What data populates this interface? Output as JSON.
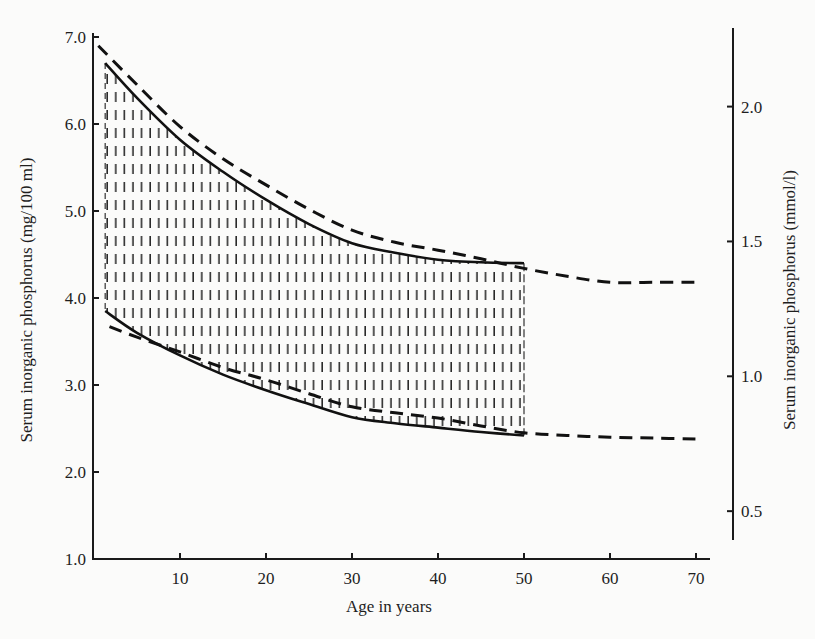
{
  "chart_data": {
    "type": "line",
    "title": "",
    "xlabel": "Age in years",
    "ylabel": "Serum inorganic phosphorus (mg/100 ml)",
    "y2label": "Serum inorganic phosphorus (mmol/l)",
    "xlim": [
      0,
      72
    ],
    "ylim": [
      1.0,
      7.0
    ],
    "y2lim": [
      0.35,
      2.3
    ],
    "x_ticks": [
      10,
      20,
      30,
      40,
      50,
      60,
      70
    ],
    "x_tick_labels": [
      "10",
      "20",
      "30",
      "40",
      "50",
      "60",
      "70"
    ],
    "y_ticks": [
      1.0,
      2.0,
      3.0,
      4.0,
      5.0,
      6.0,
      7.0
    ],
    "y_tick_labels": [
      "1.0",
      "2.0",
      "3.0",
      "4.0",
      "5.0",
      "6.0",
      "7.0"
    ],
    "y2_ticks": [
      0.5,
      1.0,
      1.5,
      2.0
    ],
    "y2_tick_labels": [
      "0.5",
      "1.0",
      "1.5",
      "2.0"
    ],
    "mg_per_mmol": 3.1,
    "grid": false,
    "legend": "none",
    "series": [
      {
        "name": "upper-limit-solid",
        "style": "solid",
        "x": [
          1.3,
          5,
          10,
          15,
          20,
          25,
          30,
          35,
          40,
          45,
          50
        ],
        "y": [
          6.7,
          6.3,
          5.82,
          5.45,
          5.13,
          4.85,
          4.63,
          4.52,
          4.44,
          4.41,
          4.4
        ]
      },
      {
        "name": "lower-limit-solid",
        "style": "solid",
        "x": [
          1.3,
          5,
          10,
          15,
          20,
          25,
          30,
          35,
          40,
          45,
          50
        ],
        "y": [
          3.85,
          3.6,
          3.34,
          3.12,
          2.94,
          2.78,
          2.63,
          2.56,
          2.51,
          2.46,
          2.42
        ]
      },
      {
        "name": "upper-limit-dashed",
        "style": "dashed",
        "x": [
          0.5,
          5,
          10,
          15,
          20,
          25,
          30,
          35,
          40,
          45,
          50,
          55,
          60,
          65,
          70
        ],
        "y": [
          6.9,
          6.45,
          5.97,
          5.6,
          5.3,
          5.02,
          4.78,
          4.64,
          4.55,
          4.45,
          4.34,
          4.25,
          4.18,
          4.18,
          4.18
        ]
      },
      {
        "name": "lower-limit-dashed",
        "style": "dashed",
        "x": [
          1.8,
          5,
          10,
          15,
          20,
          25,
          30,
          35,
          40,
          45,
          50,
          55,
          60,
          65,
          70
        ],
        "y": [
          3.67,
          3.55,
          3.38,
          3.2,
          3.06,
          2.9,
          2.75,
          2.68,
          2.62,
          2.53,
          2.45,
          2.42,
          2.4,
          2.39,
          2.38
        ]
      }
    ],
    "shaded_band": {
      "between": [
        "upper-limit-solid",
        "lower-limit-solid"
      ],
      "pattern": "vertical-dashes"
    }
  }
}
